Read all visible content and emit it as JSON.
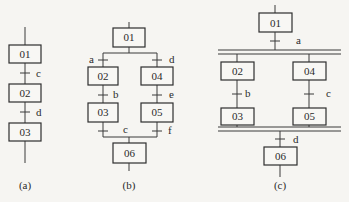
{
  "panels": {
    "a": {
      "caption": "(a)",
      "steps": [
        "01",
        "02",
        "03"
      ],
      "transitions": [
        "c",
        "d"
      ]
    },
    "b": {
      "caption": "(b)",
      "steps": [
        "01",
        "02",
        "03",
        "04",
        "05",
        "06"
      ],
      "transitions": [
        "a",
        "b",
        "c",
        "d",
        "e",
        "f"
      ]
    },
    "c": {
      "caption": "(c)",
      "steps": [
        "01",
        "02",
        "03",
        "04",
        "05",
        "06"
      ],
      "transitions": [
        "a",
        "b",
        "c",
        "d"
      ]
    }
  }
}
